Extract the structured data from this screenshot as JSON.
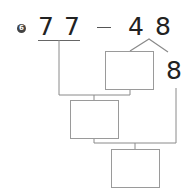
{
  "problem": {
    "number": "6",
    "tens_operand": "77",
    "tens_digit_1": "7",
    "tens_digit_2": "7",
    "operator": "−",
    "subtrahend": "48",
    "subtrahend_tens": "4",
    "subtrahend_ones": "8",
    "split_part": "8"
  },
  "boxes": [
    {
      "id": "box-1",
      "value": ""
    },
    {
      "id": "box-2",
      "value": ""
    },
    {
      "id": "box-3",
      "value": ""
    }
  ],
  "colors": {
    "line": "#8a8a8a",
    "text": "#222222",
    "badge": "#444444"
  }
}
